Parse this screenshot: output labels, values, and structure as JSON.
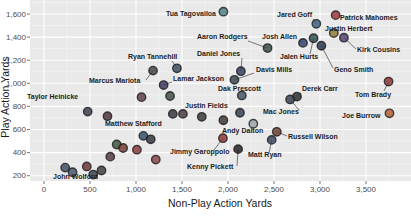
{
  "chart_data": {
    "type": "scatter",
    "title": "",
    "xlabel": "Non-Play Action Yards",
    "ylabel": "Play Action Yards",
    "x_ticks": [
      {
        "value": 0,
        "label": "0"
      },
      {
        "value": 500,
        "label": "500"
      },
      {
        "value": 1000,
        "label": "1,000"
      },
      {
        "value": 1500,
        "label": "1,500"
      },
      {
        "value": 2000,
        "label": "2,000"
      },
      {
        "value": 2500,
        "label": "2,500"
      },
      {
        "value": 3000,
        "label": "3,000"
      },
      {
        "value": 3500,
        "label": "3,500"
      }
    ],
    "y_ticks": [
      {
        "value": 200,
        "label": "200"
      },
      {
        "value": 400,
        "label": "400"
      },
      {
        "value": 600,
        "label": "600"
      },
      {
        "value": 800,
        "label": "800"
      },
      {
        "value": 1000,
        "label": "1,000"
      },
      {
        "value": 1200,
        "label": "1,200"
      },
      {
        "value": 1400,
        "label": "1,400"
      },
      {
        "value": 1600,
        "label": "1,600"
      }
    ],
    "x_range_px": {
      "v0": 0,
      "px0": 44,
      "px_per_unit": 0.092
    },
    "y_range_px": {
      "v0": 1600,
      "px0": 14,
      "px_per_unit": 0.1155
    },
    "grid": {
      "minor_x_step": 250,
      "minor_y_step": 100
    },
    "points": [
      {
        "name": "Tua Tagovailoa",
        "x": 1950,
        "y": 1620,
        "color": "#4a7d84",
        "label": {
          "lx": 216,
          "ly": 16,
          "anchor": "end"
        }
      },
      {
        "name": "Jared Goff",
        "x": 2960,
        "y": 1515,
        "color": "#3b5b7a",
        "label": {
          "lx": 312,
          "ly": 17,
          "anchor": "end"
        },
        "leader": {
          "x": 313,
          "y": 19
        }
      },
      {
        "name": "Patrick Mahomes",
        "x": 3170,
        "y": 1590,
        "color": "#9e3039",
        "label": {
          "lx": 340,
          "ly": 20,
          "anchor": "start"
        }
      },
      {
        "name": "Justin Herbert",
        "x": 3150,
        "y": 1435,
        "color": "#8a7a2e",
        "label": {
          "lx": 325,
          "ly": 31,
          "anchor": "start"
        }
      },
      {
        "name": "Kirk Cousins",
        "x": 3260,
        "y": 1395,
        "color": "#4f3a6b",
        "label": {
          "lx": 357,
          "ly": 52,
          "anchor": "start"
        },
        "leader": {
          "x": 356,
          "y": 49
        }
      },
      {
        "name": "Aaron Rodgers",
        "x": 2430,
        "y": 1305,
        "color": "#2e4a3a",
        "label": {
          "lx": 197,
          "ly": 39,
          "anchor": "start"
        },
        "leader": {
          "x": 248,
          "y": 41
        }
      },
      {
        "name": "Josh Allen",
        "x": 2815,
        "y": 1350,
        "color": "#2d3e6b",
        "label": {
          "lx": 262,
          "ly": 39,
          "anchor": "start"
        },
        "leader": {
          "x": 299,
          "y": 40
        }
      },
      {
        "name": "Jalen Hurts",
        "x": 2930,
        "y": 1390,
        "color": "#2a4a4a",
        "label": {
          "lx": 280,
          "ly": 59,
          "anchor": "start"
        },
        "leader": {
          "x": 310,
          "y": 54
        }
      },
      {
        "name": "Geno Smith",
        "x": 3015,
        "y": 1325,
        "color": "#24324d",
        "label": {
          "lx": 334,
          "ly": 72,
          "anchor": "start"
        },
        "leader": {
          "x": 333,
          "y": 68
        }
      },
      {
        "name": "Ryan Tannehill",
        "x": 1445,
        "y": 1130,
        "color": "#3a4a5e",
        "label": {
          "lx": 128,
          "ly": 59,
          "anchor": "start"
        },
        "leader": {
          "x": 172,
          "y": 61
        }
      },
      {
        "name": "Daniel Jones",
        "x": 2140,
        "y": 1105,
        "color": "#2f3b5c",
        "label": {
          "lx": 197,
          "ly": 56,
          "anchor": "start"
        },
        "leader": {
          "x": 242,
          "y": 58
        }
      },
      {
        "name": "Davis Mills",
        "x": 2070,
        "y": 1030,
        "color": "#33434f",
        "label": {
          "lx": 256,
          "ly": 72,
          "anchor": "start"
        },
        "leader": {
          "x": 254,
          "y": 73
        }
      },
      {
        "name": "Lamar Jackson",
        "x": 1300,
        "y": 985,
        "color": "#3a2f5b",
        "label": {
          "lx": 173,
          "ly": 81,
          "anchor": "start"
        },
        "leader": {
          "x": 172,
          "y": 82
        }
      },
      {
        "name": "Marcus Mariota",
        "x": 1185,
        "y": 1110,
        "color": "#3f3f3f",
        "label": {
          "lx": 89,
          "ly": 83,
          "anchor": "start"
        },
        "leader": {
          "x": 146,
          "y": 80
        }
      },
      {
        "name": "Dak Prescott",
        "x": 2150,
        "y": 895,
        "color": "#3f4f63",
        "label": {
          "lx": 218,
          "ly": 91,
          "anchor": "start"
        }
      },
      {
        "name": "Taylor Heinicke",
        "x": 1060,
        "y": 880,
        "color": "#5b3a3f",
        "label": {
          "lx": 27,
          "ly": 99,
          "anchor": "start"
        }
      },
      {
        "name": "Derek Carr",
        "x": 2750,
        "y": 885,
        "color": "#2b2b2b",
        "label": {
          "lx": 302,
          "ly": 91,
          "anchor": "start"
        },
        "leader": {
          "x": 301,
          "y": 93
        }
      },
      {
        "name": "Mac Jones",
        "x": 2675,
        "y": 860,
        "color": "#33414e",
        "label": {
          "lx": 263,
          "ly": 114,
          "anchor": "start"
        },
        "leader": {
          "x": 299,
          "y": 110
        }
      },
      {
        "name": "Tom Brady",
        "x": 3745,
        "y": 1015,
        "color": "#8a2f2f",
        "label": {
          "lx": 355,
          "ly": 97,
          "anchor": "start"
        },
        "leader": {
          "x": 384,
          "y": 91
        }
      },
      {
        "name": "Joe Burrow",
        "x": 3755,
        "y": 740,
        "color": "#b2592b",
        "label": {
          "lx": 342,
          "ly": 118,
          "anchor": "start"
        }
      },
      {
        "name": "Justin Fields",
        "x": 1400,
        "y": 735,
        "color": "#31343c",
        "label": {
          "lx": 185,
          "ly": 108,
          "anchor": "start"
        }
      },
      {
        "name": "Matthew Stafford",
        "x": 1080,
        "y": 545,
        "color": "#2f4a6b",
        "label": {
          "lx": 105,
          "ly": 126,
          "anchor": "start"
        }
      },
      {
        "name": "Andy Dalton",
        "x": 2275,
        "y": 650,
        "color": "#9aa0a6",
        "label": {
          "lx": 222,
          "ly": 133,
          "anchor": "start"
        }
      },
      {
        "name": "Jimmy Garoppolo",
        "x": 1945,
        "y": 525,
        "color": "#8a3030",
        "label": {
          "lx": 170,
          "ly": 154,
          "anchor": "start"
        },
        "leader": {
          "x": 214,
          "y": 150
        }
      },
      {
        "name": "Russell Wilson",
        "x": 2530,
        "y": 580,
        "color": "#6b3a2a",
        "label": {
          "lx": 288,
          "ly": 139,
          "anchor": "start"
        },
        "leader": {
          "x": 287,
          "y": 136
        }
      },
      {
        "name": "Matt Ryan",
        "x": 2475,
        "y": 510,
        "color": "#32435c",
        "label": {
          "lx": 248,
          "ly": 157,
          "anchor": "start"
        },
        "leader": {
          "x": 269,
          "y": 153
        }
      },
      {
        "name": "Kenny Pickett",
        "x": 2110,
        "y": 430,
        "color": "#1f1f1f",
        "label": {
          "lx": 187,
          "ly": 169,
          "anchor": "start"
        },
        "leader": {
          "x": 237,
          "y": 166
        }
      },
      {
        "name": "John Wolford",
        "x": 230,
        "y": 270,
        "color": "#394a63",
        "label": {
          "lx": 53,
          "ly": 179,
          "anchor": "start"
        }
      }
    ],
    "unlabeled_points": [
      {
        "x": 1370,
        "y": 890,
        "color": "#3a4a3a"
      },
      {
        "x": 1510,
        "y": 735,
        "color": "#44343c"
      },
      {
        "x": 1715,
        "y": 710,
        "color": "#333333"
      },
      {
        "x": 2130,
        "y": 745,
        "color": "#2f3b4c"
      },
      {
        "x": 1950,
        "y": 680,
        "color": "#403030"
      },
      {
        "x": 475,
        "y": 755,
        "color": "#333a44"
      },
      {
        "x": 690,
        "y": 715,
        "color": "#4a3038"
      },
      {
        "x": 465,
        "y": 280,
        "color": "#6b2f2f"
      },
      {
        "x": 535,
        "y": 210,
        "color": "#34404c"
      },
      {
        "x": 625,
        "y": 245,
        "color": "#3c3c3c"
      },
      {
        "x": 310,
        "y": 230,
        "color": "#44506b"
      },
      {
        "x": 720,
        "y": 365,
        "color": "#52333f"
      },
      {
        "x": 790,
        "y": 470,
        "color": "#39503a"
      },
      {
        "x": 860,
        "y": 440,
        "color": "#703a2f"
      },
      {
        "x": 1160,
        "y": 515,
        "color": "#2f2f39"
      },
      {
        "x": 1010,
        "y": 425,
        "color": "#883333"
      },
      {
        "x": 1215,
        "y": 340,
        "color": "#8a4040"
      }
    ],
    "colors": {
      "panel_bg": "#e9e9e9",
      "grid_major": "#ffffff",
      "grid_minor": "#f4f4f4",
      "tick_text": "#4d4d4d",
      "axis_title": "#1a1a1a",
      "point_label": "#1c1c1c",
      "leader_line": "#555555"
    }
  }
}
